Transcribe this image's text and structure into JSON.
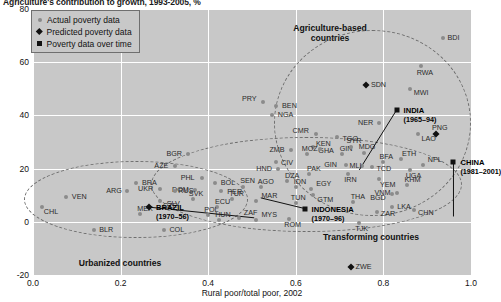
{
  "figure": {
    "title": "Agriculture's contribution to growth, 1993-2005, %",
    "xlabel": "Rural poor/total poor, 2002",
    "ylabel": ""
  },
  "legend": {
    "items": [
      {
        "marker": "circle-icon",
        "label": "Actual poverty data"
      },
      {
        "marker": "diamond-icon",
        "label": "Predicted poverty data"
      },
      {
        "marker": "square-icon",
        "label": "Poverty data over time"
      }
    ]
  },
  "annotations": [
    {
      "name": "agriculture-based-group",
      "line1": "Agriculture-based",
      "line2": "countries",
      "x": 330,
      "y": 23
    },
    {
      "name": "transforming-group",
      "line1": "Transforming countries",
      "line2": "",
      "x": 371,
      "y": 232
    },
    {
      "name": "urbanized-group",
      "line1": "Urbanized countries",
      "line2": "",
      "x": 120,
      "y": 258
    }
  ],
  "chart_data": {
    "type": "scatter",
    "title": "Agriculture's contribution to growth, 1993-2005, %",
    "xlabel": "Rural poor/total poor, 2002",
    "ylabel": "",
    "xlim": [
      0.0,
      1.0
    ],
    "ylim": [
      -20,
      80
    ],
    "xticks": [
      "0.0",
      "0.2",
      "0.4",
      "0.6",
      "0.8",
      "1.0"
    ],
    "yticks": [
      "80",
      "60",
      "40",
      "20",
      "0",
      "-20"
    ],
    "grid": true,
    "legend_position": "top-left",
    "series": [
      {
        "name": "Actual poverty data",
        "marker": "circle",
        "color": "#8b8b8b",
        "points": [
          {
            "label": "VEN",
            "x": 0.075,
            "y": 9.5,
            "lx": 6,
            "ly": -1
          },
          {
            "label": "BRA",
            "x": 0.235,
            "y": 14.5,
            "lx": 6,
            "ly": -1
          },
          {
            "label": "BGR",
            "x": 0.355,
            "y": 25.5,
            "lx": -22,
            "ly": -1
          },
          {
            "label": "AZE",
            "x": 0.325,
            "y": 21.0,
            "lx": -21,
            "ly": -1
          },
          {
            "label": "PRY",
            "x": 0.525,
            "y": 45.0,
            "lx": -21,
            "ly": -4
          },
          {
            "label": "BEN",
            "x": 0.555,
            "y": 43.5,
            "lx": 6,
            "ly": -1
          },
          {
            "label": "NGA",
            "x": 0.545,
            "y": 40.0,
            "lx": 6,
            "ly": -1
          },
          {
            "label": "CMR",
            "x": 0.645,
            "y": 33.0,
            "lx": -23,
            "ly": -4
          },
          {
            "label": "GHA",
            "x": 0.64,
            "y": 28.0,
            "lx": 5,
            "ly": 3
          },
          {
            "label": "CIV",
            "x": 0.555,
            "y": 22.5,
            "lx": 5,
            "ly": 0
          },
          {
            "label": "SEN",
            "x": 0.48,
            "y": 13.0,
            "lx": -3,
            "ly": -7
          },
          {
            "label": "BOL",
            "x": 0.415,
            "y": 14.5,
            "lx": 6,
            "ly": -1
          },
          {
            "label": "PHL",
            "x": 0.385,
            "y": 16.5,
            "lx": -21,
            "ly": -1
          },
          {
            "label": "DOM",
            "x": 0.37,
            "y": 12.0,
            "lx": -23,
            "ly": -1
          },
          {
            "label": "PER",
            "x": 0.43,
            "y": 11.5,
            "lx": 6,
            "ly": 0
          },
          {
            "label": "SVK",
            "x": 0.365,
            "y": 8.5,
            "lx": -4,
            "ly": -6
          },
          {
            "label": "SLV",
            "x": 0.31,
            "y": 5.0,
            "lx": -2,
            "ly": -6
          },
          {
            "label": "ECU",
            "x": 0.42,
            "y": 5.5,
            "lx": -2,
            "ly": -6
          },
          {
            "label": "MEX",
            "x": 0.245,
            "y": 3.0,
            "lx": -3,
            "ly": -6
          },
          {
            "label": "POL",
            "x": 0.4,
            "y": 2.5,
            "lx": -4,
            "ly": -6
          },
          {
            "label": "HUN",
            "x": 0.425,
            "y": 0.5,
            "lx": -4,
            "ly": -6
          },
          {
            "label": "ZAF",
            "x": 0.47,
            "y": 1.5,
            "lx": 0,
            "ly": -6
          },
          {
            "label": "MYS",
            "x": 0.51,
            "y": 0.5,
            "lx": 0,
            "ly": -6
          },
          {
            "label": "COL",
            "x": 0.3,
            "y": -3.0,
            "lx": 5,
            "ly": -1
          },
          {
            "label": "BLR",
            "x": 0.14,
            "y": -3.0,
            "lx": 5,
            "ly": -1
          },
          {
            "label": "TUR",
            "x": 0.455,
            "y": 8.5,
            "lx": -3,
            "ly": -6
          },
          {
            "label": "MAR",
            "x": 0.51,
            "y": 8.0,
            "lx": 0,
            "ly": -6
          },
          {
            "label": "AGO",
            "x": 0.52,
            "y": 13.0,
            "lx": -3,
            "ly": -6
          },
          {
            "label": "ZMB",
            "x": 0.59,
            "y": 27.0,
            "lx": -22,
            "ly": -1
          },
          {
            "label": "MOZ",
            "x": 0.625,
            "y": 25.5,
            "lx": -5,
            "ly": -6
          },
          {
            "label": "KEN",
            "x": 0.655,
            "y": 27.5,
            "lx": -4,
            "ly": -6
          },
          {
            "label": "GIN",
            "x": 0.705,
            "y": 25.5,
            "lx": -2,
            "ly": -6
          },
          {
            "label": "HND",
            "x": 0.56,
            "y": 20.0,
            "lx": -22,
            "ly": -1
          },
          {
            "label": "PAK",
            "x": 0.63,
            "y": 18.0,
            "lx": -2,
            "ly": -6
          },
          {
            "label": "DZA",
            "x": 0.58,
            "y": 15.5,
            "lx": -2,
            "ly": -6
          },
          {
            "label": "IDN",
            "x": 0.6,
            "y": 13.0,
            "lx": -2,
            "ly": -6
          },
          {
            "label": "EGY",
            "x": 0.635,
            "y": 12.5,
            "lx": 0,
            "ly": -6
          },
          {
            "label": "GTM",
            "x": 0.64,
            "y": 10.0,
            "lx": 4,
            "ly": 4
          },
          {
            "label": "TUN",
            "x": 0.6,
            "y": 7.0,
            "lx": -5,
            "ly": -6
          },
          {
            "label": "SYR",
            "x": 0.725,
            "y": 28.0,
            "lx": -4,
            "ly": -7
          },
          {
            "label": "TGO",
            "x": 0.695,
            "y": 32.0,
            "lx": 5,
            "ly": 1
          },
          {
            "label": "MDG",
            "x": 0.755,
            "y": 26.0,
            "lx": -5,
            "ly": -7
          },
          {
            "label": "MLI",
            "x": 0.75,
            "y": 21.0,
            "lx": -12,
            "ly": -1
          },
          {
            "label": "TCD",
            "x": 0.775,
            "y": 20.5,
            "lx": 4,
            "ly": 1
          },
          {
            "label": "BFA",
            "x": 0.8,
            "y": 22.5,
            "lx": -4,
            "ly": -6
          },
          {
            "label": "ETH",
            "x": 0.84,
            "y": 23.5,
            "lx": 1,
            "ly": -6
          },
          {
            "label": "UGA",
            "x": 0.86,
            "y": 19.5,
            "lx": -4,
            "ly": 5
          },
          {
            "label": "NPL",
            "x": 0.89,
            "y": 21.5,
            "lx": 0,
            "ly": -6
          },
          {
            "label": "NER",
            "x": 0.79,
            "y": 37.0,
            "lx": -21,
            "ly": -1
          },
          {
            "label": "MWI",
            "x": 0.86,
            "y": 50.0,
            "lx": 4,
            "ly": 3
          },
          {
            "label": "RWA",
            "x": 0.885,
            "y": 58.5,
            "lx": -4,
            "ly": 6
          },
          {
            "label": "BDI",
            "x": 0.935,
            "y": 69.0,
            "lx": 5,
            "ly": -1
          },
          {
            "label": "LAO",
            "x": 0.88,
            "y": 33.0,
            "lx": 3,
            "ly": 4
          },
          {
            "label": "KHM",
            "x": 0.855,
            "y": 14.0,
            "lx": -3,
            "ly": -6
          },
          {
            "label": "VNM",
            "x": 0.83,
            "y": 11.0,
            "lx": -22,
            "ly": -1
          },
          {
            "label": "IRN",
            "x": 0.72,
            "y": 18.0,
            "lx": -4,
            "ly": 5
          },
          {
            "label": "YEM",
            "x": 0.79,
            "y": 16.0,
            "lx": 1,
            "ly": 5
          },
          {
            "label": "LKA",
            "x": 0.82,
            "y": 5.5,
            "lx": 5,
            "ly": -1
          },
          {
            "label": "THA",
            "x": 0.73,
            "y": 7.5,
            "lx": -2,
            "ly": -6
          },
          {
            "label": "ZAR",
            "x": 0.785,
            "y": 3.5,
            "lx": 4,
            "ly": 1
          },
          {
            "label": "TJK",
            "x": 0.745,
            "y": -0.5,
            "lx": -4,
            "ly": 5
          },
          {
            "label": "ROM",
            "x": 0.585,
            "y": 1.0,
            "lx": -5,
            "ly": 5
          },
          {
            "label": "CHN",
            "x": 0.87,
            "y": 4.5,
            "lx": 4,
            "ly": 2
          },
          {
            "label": "UKR",
            "x": 0.29,
            "y": 12.5,
            "lx": -22,
            "ly": -1
          },
          {
            "label": "RUS",
            "x": 0.325,
            "y": 11.5,
            "lx": 3,
            "ly": -1
          },
          {
            "label": "CZE",
            "x": 0.29,
            "y": 8.0,
            "lx": 3,
            "ly": 4
          },
          {
            "label": "ARG",
            "x": 0.215,
            "y": 11.5,
            "lx": -21,
            "ly": -1
          },
          {
            "label": "CHL",
            "x": 0.02,
            "y": 5.5,
            "lx": 2,
            "ly": 4
          },
          {
            "label": "GIN2",
            "x": 0.715,
            "y": 21.5,
            "lx": -22,
            "ly": -1
          },
          {
            "label": "BGD",
            "x": 0.82,
            "y": 10.5,
            "lx": -22,
            "ly": 3
          }
        ]
      },
      {
        "name": "Predicted poverty data",
        "marker": "diamond",
        "color": "#111111",
        "points": [
          {
            "label": "SDN",
            "x": 0.76,
            "y": 51.5,
            "lx": 5,
            "ly": -1
          },
          {
            "label": "PNG",
            "x": 0.92,
            "y": 33.0,
            "lx": -4,
            "ly": -7
          },
          {
            "label": "ZWE",
            "x": 0.725,
            "y": -17.0,
            "lx": 5,
            "ly": -1
          },
          {
            "label": "BRAZIL",
            "x": 0.265,
            "y": 5.5,
            "lx": 0,
            "ly": 0,
            "bold": true,
            "labels": [
              "BRAZIL",
              "(1970–56)"
            ]
          }
        ]
      },
      {
        "name": "Poverty data over time",
        "marker": "square",
        "color": "#111111",
        "points": [
          {
            "label": "INDIA",
            "x": 0.83,
            "y": 42.0,
            "lx": 0,
            "ly": 0,
            "bold": true,
            "labels": [
              "INDIA",
              "(1965–94)"
            ]
          },
          {
            "label": "CHINA",
            "x": 0.96,
            "y": 22.5,
            "lx": 0,
            "ly": 0,
            "bold": true,
            "labels": [
              "CHINA",
              "(1981–2001)"
            ]
          },
          {
            "label": "INDONESIA",
            "x": 0.62,
            "y": 5.0,
            "lx": 0,
            "ly": 0,
            "bold": true,
            "labels": [
              "INDONESIA",
              "(1970–96)"
            ]
          }
        ]
      }
    ],
    "trend_lines": [
      {
        "name": "brazil-line",
        "x1": 0.265,
        "y1": 5.5,
        "x2": 0.505,
        "y2": 1.5
      },
      {
        "name": "india-line",
        "x1": 0.83,
        "y1": 42.0,
        "x2": 0.745,
        "y2": 19.5
      },
      {
        "name": "china-line",
        "x1": 0.96,
        "y1": 22.5,
        "x2": 0.96,
        "y2": 2.0
      },
      {
        "name": "indonesia-line",
        "x1": 0.62,
        "y1": 5.0,
        "x2": 0.52,
        "y2": 9.0
      }
    ],
    "group_ellipses": [
      {
        "name": "agriculture-based",
        "cx": 0.775,
        "cy": 37.0,
        "rx": 0.225,
        "ry": 35.0
      },
      {
        "name": "transforming",
        "cx": 0.625,
        "cy": 14.0,
        "rx": 0.355,
        "ry": 18.0
      },
      {
        "name": "urbanized",
        "cx": 0.235,
        "cy": 8.5,
        "rx": 0.255,
        "ry": 14.5
      }
    ]
  }
}
